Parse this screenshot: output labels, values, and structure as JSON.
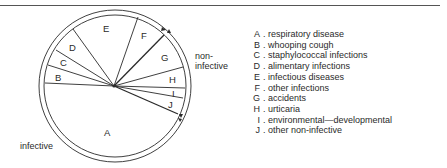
{
  "figure": {
    "group_labels": {
      "infective": "infective",
      "non_infective_line1": "non-",
      "non_infective_line2": "infective"
    },
    "segments": [
      {
        "key": "A",
        "label": "respiratory disease",
        "group": "infective"
      },
      {
        "key": "B",
        "label": "whooping cough",
        "group": "infective"
      },
      {
        "key": "C",
        "label": "staphylococcal infections",
        "group": "infective"
      },
      {
        "key": "D",
        "label": "alimentary infections",
        "group": "infective"
      },
      {
        "key": "E",
        "label": "infectious diseases",
        "group": "infective"
      },
      {
        "key": "F",
        "label": "other infections",
        "group": "infective"
      },
      {
        "key": "G",
        "label": "accidents",
        "group": "non-infective"
      },
      {
        "key": "H",
        "label": "urticaria",
        "group": "non-infective"
      },
      {
        "key": "I",
        "label": "environmental—developmental",
        "group": "non-infective"
      },
      {
        "key": "J",
        "label": "other non-infective",
        "group": "non-infective"
      }
    ],
    "colors": {
      "line": "#2a2a2a",
      "background": "#ffffff"
    }
  }
}
